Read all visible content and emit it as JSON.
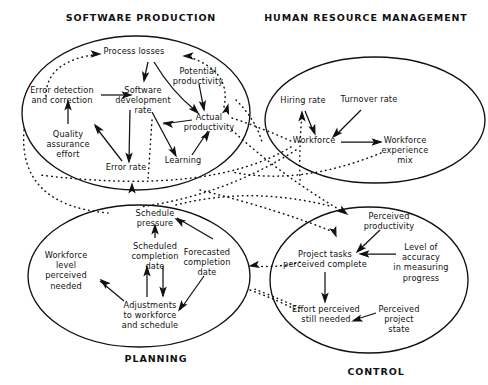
{
  "figure": {
    "background_color": "#ffffff",
    "ink_color": "#111111",
    "width": 488,
    "height": 385,
    "type": "causal-loop-diagram"
  },
  "sectors": [
    {
      "id": "software-production",
      "title": "SOFTWARE PRODUCTION",
      "title_x": 141,
      "title_y": 21,
      "ellipse": {
        "cx": 136,
        "cy": 113,
        "rx": 114,
        "ry": 77
      }
    },
    {
      "id": "human-resource-management",
      "title": "HUMAN RESOURCE MANAGEMENT",
      "title_x": 366,
      "title_y": 21,
      "ellipse": {
        "cx": 375,
        "cy": 120,
        "rx": 110,
        "ry": 63
      }
    },
    {
      "id": "planning",
      "title": "PLANNING",
      "title_x": 156,
      "title_y": 362,
      "ellipse": {
        "cx": 139,
        "cy": 276,
        "rx": 111,
        "ry": 71
      }
    },
    {
      "id": "control",
      "title": "CONTROL",
      "title_x": 376,
      "title_y": 375,
      "ellipse": {
        "cx": 369,
        "cy": 280,
        "rx": 99,
        "ry": 73
      }
    }
  ],
  "nodes": [
    {
      "id": "process-losses",
      "sector": "software-production",
      "x": 134,
      "y": 54,
      "lines": [
        "Process losses"
      ]
    },
    {
      "id": "potential-productivity",
      "sector": "software-production",
      "x": 198,
      "y": 74,
      "lines": [
        "Potential",
        "productivity"
      ]
    },
    {
      "id": "error-detection-correction",
      "sector": "software-production",
      "x": 62,
      "y": 93,
      "lines": [
        "Error detection",
        "and correction"
      ]
    },
    {
      "id": "software-development-rate",
      "sector": "software-production",
      "x": 143,
      "y": 93,
      "lines": [
        "Software",
        "development",
        "rate"
      ]
    },
    {
      "id": "actual-productivity",
      "sector": "software-production",
      "x": 209,
      "y": 120,
      "lines": [
        "Actual",
        "productivity"
      ]
    },
    {
      "id": "quality-assurance-effort",
      "sector": "software-production",
      "x": 68,
      "y": 137,
      "lines": [
        "Quality",
        "assurance",
        "effort"
      ]
    },
    {
      "id": "error-rate",
      "sector": "software-production",
      "x": 126,
      "y": 170,
      "lines": [
        "Error rate"
      ]
    },
    {
      "id": "learning",
      "sector": "software-production",
      "x": 183,
      "y": 163,
      "lines": [
        "Learning"
      ]
    },
    {
      "id": "hiring-rate",
      "sector": "human-resource-management",
      "x": 303,
      "y": 103,
      "lines": [
        "Hiring rate"
      ]
    },
    {
      "id": "turnover-rate",
      "sector": "human-resource-management",
      "x": 369,
      "y": 102,
      "lines": [
        "Turnover rate"
      ]
    },
    {
      "id": "workforce",
      "sector": "human-resource-management",
      "x": 314,
      "y": 143,
      "lines": [
        "Workforce"
      ]
    },
    {
      "id": "workforce-experience-mix",
      "sector": "human-resource-management",
      "x": 405,
      "y": 143,
      "lines": [
        "Workforce",
        "experience",
        "mix"
      ]
    },
    {
      "id": "schedule-pressure",
      "sector": "planning",
      "x": 155,
      "y": 216,
      "lines": [
        "Schedule",
        "pressure"
      ]
    },
    {
      "id": "scheduled-completion-date",
      "sector": "planning",
      "x": 155,
      "y": 249,
      "lines": [
        "Scheduled",
        "completion",
        "date"
      ]
    },
    {
      "id": "forecasted-completion-date",
      "sector": "planning",
      "x": 207,
      "y": 255,
      "lines": [
        "Forecasted",
        "completion",
        "date"
      ]
    },
    {
      "id": "workforce-level-perceived-needed",
      "sector": "planning",
      "x": 66,
      "y": 258,
      "lines": [
        "Workforce",
        "level",
        "perceived",
        "needed"
      ]
    },
    {
      "id": "adjustments-to-workforce-and-schedule",
      "sector": "planning",
      "x": 150,
      "y": 308,
      "lines": [
        "Adjustments",
        "to workforce",
        "and schedule"
      ]
    },
    {
      "id": "perceived-productivity",
      "sector": "control",
      "x": 389,
      "y": 219,
      "lines": [
        "Perceived",
        "productivity"
      ]
    },
    {
      "id": "project-tasks-perceived-complete",
      "sector": "control",
      "x": 325,
      "y": 257,
      "lines": [
        "Project tasks",
        "perceived complete"
      ]
    },
    {
      "id": "level-of-accuracy-in-measuring-progress",
      "sector": "control",
      "x": 421,
      "y": 250,
      "lines": [
        "Level of",
        "accuracy",
        "in measuring",
        "progress"
      ]
    },
    {
      "id": "effort-perceived-still-needed",
      "sector": "control",
      "x": 326,
      "y": 312,
      "lines": [
        "Effort perceived",
        "still needed"
      ]
    },
    {
      "id": "perceived-project-state",
      "sector": "control",
      "x": 399,
      "y": 312,
      "lines": [
        "Perceived",
        "project",
        "state"
      ]
    }
  ],
  "solid_links": [
    {
      "id": "qa-effort-to-error-detection",
      "from": "quality-assurance-effort",
      "to": "error-detection-correction",
      "d": "M 68 124 L 68 103"
    },
    {
      "id": "error-detection-to-dev-rate",
      "from": "error-detection-correction",
      "to": "software-development-rate",
      "d": "M 101 95 L 130 95"
    },
    {
      "id": "process-losses-to-dev-rate",
      "from": "process-losses",
      "to": "software-development-rate",
      "d": "M 148 62 L 144 80"
    },
    {
      "id": "process-losses-to-actual-prod",
      "from": "process-losses",
      "to": "actual-productivity",
      "d": "M 154 62 Q 172 92 196 111"
    },
    {
      "id": "potential-prod-to-actual-prod",
      "from": "potential-productivity",
      "to": "actual-productivity",
      "d": "M 199 84 L 204 110"
    },
    {
      "id": "dev-rate-to-error-rate",
      "from": "software-development-rate",
      "to": "error-rate",
      "d": "M 130 110 L 129 160"
    },
    {
      "id": "dev-rate-to-learning",
      "from": "software-development-rate",
      "to": "learning",
      "d": "M 152 112 L 175 155"
    },
    {
      "id": "learning-to-actual-productivity",
      "from": "learning",
      "to": "actual-productivity",
      "d": "M 192 155 L 208 131"
    },
    {
      "id": "actual-prod-to-dev-rate",
      "from": "actual-productivity",
      "to": "software-development-rate",
      "d": "M 192 120 L 163 124"
    },
    {
      "id": "error-rate-to-qa-effort",
      "from": "error-rate",
      "to": "quality-assurance-effort",
      "d": "M 122 161 L 95 126"
    },
    {
      "id": "hiring-rate-to-workforce",
      "from": "hiring-rate",
      "to": "workforce",
      "d": "M 305 111 L 314 133"
    },
    {
      "id": "turnover-rate-to-workforce",
      "from": "turnover-rate",
      "to": "workforce",
      "d": "M 361 110 L 335 136"
    },
    {
      "id": "workforce-to-experience-mix",
      "from": "workforce",
      "to": "workforce-experience-mix",
      "d": "M 341 142 L 381 142"
    },
    {
      "id": "scheduled-date-to-schedule-pressure",
      "from": "scheduled-completion-date",
      "to": "schedule-pressure",
      "d": "M 155 238 L 155 226"
    },
    {
      "id": "forecasted-to-schedule-pressure",
      "from": "forecasted-completion-date",
      "to": "schedule-pressure",
      "d": "M 213 239 L 177 218"
    },
    {
      "id": "forecasted-to-adjustments",
      "from": "forecasted-completion-date",
      "to": "adjustments-to-workforce-and-schedule",
      "d": "M 204 276 L 180 310"
    },
    {
      "id": "adjustments-to-workforce-level",
      "from": "adjustments-to-workforce-and-schedule",
      "to": "workforce-level-perceived-needed",
      "d": "M 124 301 L 100 281"
    },
    {
      "id": "adjustments-to-scheduled-date",
      "from": "adjustments-to-workforce-and-schedule",
      "to": "scheduled-completion-date",
      "d": "M 147 297 L 147 266"
    },
    {
      "id": "scheduled-date-to-adjustments",
      "from": "scheduled-completion-date",
      "to": "adjustments-to-workforce-and-schedule",
      "d": "M 163 266 L 163 296"
    },
    {
      "id": "perceived-prod-to-project-tasks",
      "from": "perceived-productivity",
      "to": "project-tasks-perceived-complete",
      "d": "M 380 230 L 358 251"
    },
    {
      "id": "level-accuracy-to-project-tasks",
      "from": "level-of-accuracy-in-measuring-progress",
      "to": "project-tasks-perceived-complete",
      "d": "M 396 254 L 361 254"
    },
    {
      "id": "project-tasks-to-effort-needed",
      "from": "project-tasks-perceived-complete",
      "to": "effort-perceived-still-needed",
      "d": "M 325 272 L 325 300"
    },
    {
      "id": "perceived-state-to-effort-needed",
      "from": "perceived-project-state",
      "to": "effort-perceived-still-needed",
      "d": "M 376 313 L 354 320"
    }
  ],
  "dotted_links": [
    {
      "id": "actual-prod-to-process-losses",
      "d": "M 224 107 Q 232 70 186 56"
    },
    {
      "id": "dev-rate-to-process-losses-left",
      "d": "M 46 96 Q 46 60 100 54"
    },
    {
      "id": "actual-prod-to-perceived-prod",
      "d": "M 232 130 Q 280 175 345 213"
    },
    {
      "id": "actual-prod-to-workforce",
      "d": "M 232 118 Q 262 128 291 141"
    },
    {
      "id": "workforce-to-sp-left",
      "d": "M 291 147 Q 210 196 40 175"
    },
    {
      "id": "workforce-to-schedule-pressure",
      "d": "M 296 150 Q 225 195 140 207"
    },
    {
      "id": "hiring-rate-up-from-below",
      "d": "M 300 180 Q 299 150 302 113"
    },
    {
      "id": "sp-left-to-planning",
      "d": "M 24 130 Q 18 205 108 213"
    },
    {
      "id": "experience-mix-to-sp",
      "d": "M 381 153 Q 300 186 232 172"
    },
    {
      "id": "control-to-planning",
      "d": "M 300 262 Q 280 268 254 266"
    },
    {
      "id": "planning-to-control-lower",
      "d": "M 250 290 Q 278 300 300 312"
    },
    {
      "id": "effort-needed-to-workforce-level",
      "d": "M 300 308 Q 272 296 252 288"
    },
    {
      "id": "schedule-pressure-to-control",
      "d": "M 176 205 Q 250 186 330 206"
    },
    {
      "id": "sp-bottom-to-control",
      "d": "M 200 190 Q 280 210 336 233"
    },
    {
      "id": "error-rate-dotted-down",
      "d": "M 152 120 Q 150 150 148 180"
    },
    {
      "id": "potential-prod-dotted-right",
      "d": "M 236 100 Q 256 120 262 142"
    }
  ],
  "arrowheads": [
    {
      "id": "ah-process-losses-in-left",
      "x": 100,
      "y": 54,
      "angle": 0,
      "style": "dotted-target"
    },
    {
      "id": "ah-process-losses-in-right",
      "x": 184,
      "y": 56,
      "angle": 180,
      "style": "dotted-target"
    },
    {
      "id": "ah-dev-rate-from-losses",
      "x": 144,
      "y": 81,
      "angle": 100,
      "style": "solid"
    },
    {
      "id": "ah-actual-from-losses",
      "x": 198,
      "y": 113,
      "angle": 45,
      "style": "solid"
    },
    {
      "id": "ah-actual-from-potential",
      "x": 204,
      "y": 110,
      "angle": 80,
      "style": "solid"
    },
    {
      "id": "ah-actual-from-right-dotted",
      "x": 228,
      "y": 105,
      "angle": -75,
      "style": "solid"
    },
    {
      "id": "ah-dev-rate-from-error-det",
      "x": 131,
      "y": 95,
      "angle": 0,
      "style": "solid"
    },
    {
      "id": "ah-error-det-from-qa",
      "x": 68,
      "y": 101,
      "angle": -90,
      "style": "solid"
    },
    {
      "id": "ah-error-rate-from-dev",
      "x": 129,
      "y": 162,
      "angle": 90,
      "style": "solid"
    },
    {
      "id": "ah-learning-from-dev",
      "x": 176,
      "y": 156,
      "angle": 62,
      "style": "solid"
    },
    {
      "id": "ah-actual-from-learning",
      "x": 209,
      "y": 132,
      "angle": -56,
      "style": "solid"
    },
    {
      "id": "ah-dev-rate-from-actual",
      "x": 164,
      "y": 123,
      "angle": 188,
      "style": "solid"
    },
    {
      "id": "ah-qa-from-error-rate",
      "x": 95,
      "y": 125,
      "angle": -128,
      "style": "solid"
    },
    {
      "id": "ah-error-rate-bottom",
      "x": 132,
      "y": 184,
      "angle": -90,
      "style": "solid"
    },
    {
      "id": "ah-hiring-rate-bottom",
      "x": 302,
      "y": 112,
      "angle": -90,
      "style": "solid"
    },
    {
      "id": "ah-workforce-from-hiring",
      "x": 315,
      "y": 134,
      "angle": 70,
      "style": "solid"
    },
    {
      "id": "ah-workforce-from-turnover",
      "x": 333,
      "y": 137,
      "angle": 135,
      "style": "solid"
    },
    {
      "id": "ah-exp-mix-from-workforce",
      "x": 381,
      "y": 142,
      "angle": 0,
      "style": "solid"
    },
    {
      "id": "ah-sched-pressure-from-sched",
      "x": 155,
      "y": 225,
      "angle": -90,
      "style": "solid"
    },
    {
      "id": "ah-sched-pressure-from-fore",
      "x": 176,
      "y": 219,
      "angle": -150,
      "style": "solid"
    },
    {
      "id": "ah-adjust-from-forecast",
      "x": 179,
      "y": 310,
      "angle": 125,
      "style": "solid"
    },
    {
      "id": "ah-wf-level-from-adjust",
      "x": 101,
      "y": 280,
      "angle": -140,
      "style": "solid"
    },
    {
      "id": "ah-sched-date-from-adjust",
      "x": 147,
      "y": 267,
      "angle": -90,
      "style": "solid"
    },
    {
      "id": "ah-adjust-from-sched-date",
      "x": 163,
      "y": 296,
      "angle": 90,
      "style": "solid"
    },
    {
      "id": "ah-planning-right-in",
      "x": 250,
      "y": 266,
      "angle": 170,
      "style": "solid"
    },
    {
      "id": "ah-perceived-prod-in",
      "x": 347,
      "y": 214,
      "angle": 35,
      "style": "solid"
    },
    {
      "id": "ah-project-tasks-top",
      "x": 336,
      "y": 236,
      "angle": 70,
      "style": "solid"
    },
    {
      "id": "ah-project-tasks-from-prod",
      "x": 357,
      "y": 252,
      "angle": 135,
      "style": "solid"
    },
    {
      "id": "ah-project-tasks-from-acc",
      "x": 360,
      "y": 254,
      "angle": 180,
      "style": "solid"
    },
    {
      "id": "ah-effort-from-tasks",
      "x": 325,
      "y": 302,
      "angle": 90,
      "style": "solid"
    },
    {
      "id": "ah-effort-from-state",
      "x": 353,
      "y": 321,
      "angle": 162,
      "style": "solid"
    }
  ]
}
